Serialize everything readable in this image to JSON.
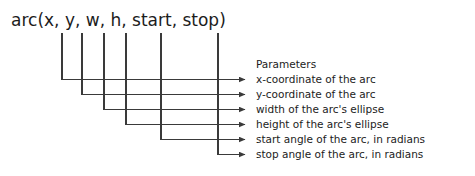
{
  "diagram": {
    "signature": "arc(x, y, w, h, start, stop)",
    "heading": "Parameters",
    "stroke_color": "#3a3a3a",
    "text_color": "#1c1c1c",
    "background_color": "#ffffff",
    "parameters": [
      {
        "name": "x",
        "description": "x-coordinate of the arc"
      },
      {
        "name": "y",
        "description": "y-coordinate of the arc"
      },
      {
        "name": "w",
        "description": "width of the arc's ellipse"
      },
      {
        "name": "h",
        "description": "height of the arc's ellipse"
      },
      {
        "name": "start",
        "description": "start angle of the arc, in radians"
      },
      {
        "name": "stop",
        "description": "stop angle of the arc, in radians"
      }
    ]
  }
}
